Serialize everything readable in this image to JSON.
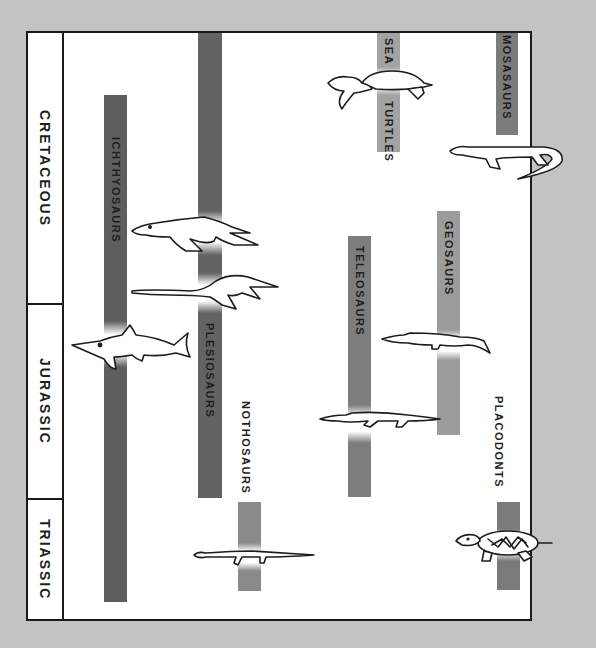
{
  "diagram": {
    "type": "geologic-time-range-chart",
    "periods": [
      {
        "label": "CRETACEOUS",
        "top": 0,
        "height": 270
      },
      {
        "label": "JURASSIC",
        "top": 270,
        "height": 195
      },
      {
        "label": "TRIASSIC",
        "top": 465,
        "height": 121
      }
    ],
    "colors": {
      "background": "#c3c3c3",
      "panel": "#ffffff",
      "border": "#1a1a1a",
      "bar_dark": "#5f5f5f",
      "bar_medium": "#7e7e7e",
      "bar_light": "#a0a0a0"
    },
    "groups": [
      {
        "label": "ICHTHYOSAURS",
        "periods_spanned": [
          "Triassic",
          "Jurassic",
          "Cretaceous"
        ],
        "tone": "dark"
      },
      {
        "label": "PLESIOSAURS",
        "periods_spanned": [
          "Jurassic",
          "Cretaceous"
        ],
        "tone": "dark"
      },
      {
        "label": "NOTHOSAURS",
        "periods_spanned": [
          "Triassic"
        ],
        "tone": "medium"
      },
      {
        "label": "TELEOSAURS",
        "periods_spanned": [
          "Jurassic"
        ],
        "tone": "medium"
      },
      {
        "label": "GEOSAURS",
        "periods_spanned": [
          "Jurassic",
          "Cretaceous"
        ],
        "tone": "light"
      },
      {
        "label": "SEA",
        "label2": "TURTLES",
        "periods_spanned": [
          "Cretaceous"
        ],
        "tone": "light"
      },
      {
        "label": "MOSASAURS",
        "periods_spanned": [
          "Cretaceous"
        ],
        "tone": "medium"
      },
      {
        "label": "PLACODONTS",
        "periods_spanned": [
          "Triassic"
        ],
        "tone": "medium"
      }
    ],
    "illustrations": [
      "ichthyosaur-icon",
      "pliosaur-icon",
      "plesiosaur-icon",
      "nothosaur-icon",
      "teleosaur-icon",
      "geosaur-icon",
      "sea-turtle-icon",
      "mosasaur-icon",
      "placodont-icon"
    ]
  }
}
